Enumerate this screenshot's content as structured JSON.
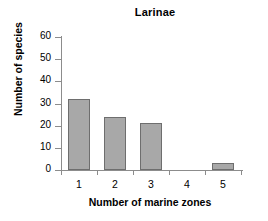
{
  "chart_data": {
    "type": "bar",
    "title": "Larinae",
    "xlabel": "Number of marine zones",
    "ylabel": "Number of species",
    "categories": [
      "1",
      "2",
      "3",
      "4",
      "5"
    ],
    "values": [
      32,
      24,
      21,
      0,
      3
    ],
    "ylim": [
      0,
      60
    ],
    "yticks": [
      "0",
      "10",
      "20",
      "30",
      "40",
      "50",
      "60"
    ],
    "ytick_values": [
      0,
      10,
      20,
      30,
      40,
      50,
      60
    ],
    "grid": false,
    "legend": "none",
    "bar_fill_color": "#a8a8a8",
    "bar_border_color": "#6e6e6e",
    "axis_color": "#8c8c8c",
    "background_color": "#ffffff"
  }
}
